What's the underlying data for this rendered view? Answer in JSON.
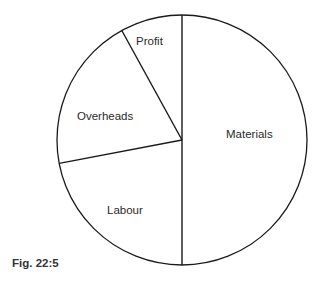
{
  "chart_data": {
    "type": "pie",
    "title": "",
    "caption": "Fig. 22:5",
    "categories": [
      "Materials",
      "Labour",
      "Overheads",
      "Profit"
    ],
    "values": [
      50,
      22,
      20,
      8
    ],
    "unit": "percent (estimated from slice angles)",
    "start_angle_deg": 90,
    "direction": "clockwise",
    "legend": "none",
    "slice_fill": "#ffffff",
    "stroke_color": "#1a1a1a"
  },
  "labels": {
    "materials": "Materials",
    "labour": "Labour",
    "overheads": "Overheads",
    "profit": "Profit"
  },
  "figure": {
    "caption": "Fig. 22:5"
  }
}
